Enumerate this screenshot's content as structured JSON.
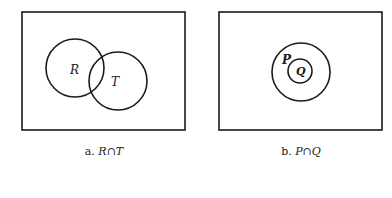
{
  "diagrams": [
    {
      "id": "a",
      "caption_prefix": "a.",
      "caption_expr": "R∩T",
      "relation": "overlapping",
      "sets": [
        {
          "label": "R"
        },
        {
          "label": "T"
        }
      ]
    },
    {
      "id": "b",
      "caption_prefix": "b.",
      "caption_expr": "P∩Q",
      "relation": "nested",
      "sets": [
        {
          "label": "P"
        },
        {
          "label": "Q"
        }
      ]
    }
  ],
  "colors": {
    "stroke": "#1a1a1a",
    "background": "#ffffff"
  }
}
